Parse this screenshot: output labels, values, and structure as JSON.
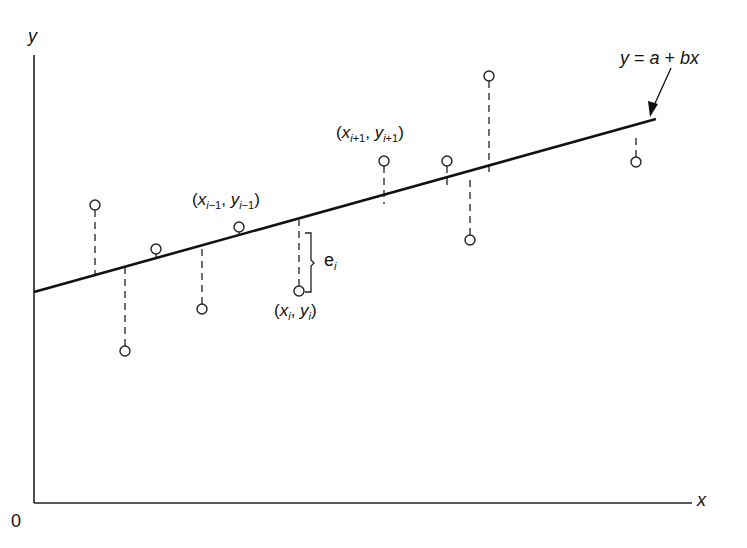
{
  "chart_data": {
    "type": "scatter",
    "title": "",
    "xlabel": "x",
    "ylabel": "y",
    "origin_label": "0",
    "grid": false,
    "legend": null,
    "regression_line": {
      "equation": "y = a + bx",
      "start_px": [
        34,
        292
      ],
      "end_px": [
        656,
        119
      ]
    },
    "points_px": [
      {
        "x": 95,
        "y": 205,
        "line_y": 275
      },
      {
        "x": 125,
        "y": 351,
        "line_y": 267
      },
      {
        "x": 156,
        "y": 249,
        "line_y": 258
      },
      {
        "x": 202,
        "y": 309,
        "line_y": 245
      },
      {
        "x": 239,
        "y": 227,
        "line_y": 236
      },
      {
        "x": 299,
        "y": 291,
        "line_y": 220
      },
      {
        "x": 384,
        "y": 161,
        "line_y": 204
      },
      {
        "x": 447,
        "y": 161,
        "line_y": 186
      },
      {
        "x": 470,
        "y": 240,
        "line_y": 180
      },
      {
        "x": 489,
        "y": 76,
        "line_y": 175
      },
      {
        "x": 636,
        "y": 162,
        "line_y": 134
      }
    ],
    "annotations": [
      {
        "text": "(x_{i-1}, y_{i-1})",
        "point_index": 4
      },
      {
        "text": "(x_i, y_i)",
        "point_index": 5
      },
      {
        "text": "(x_{i+1}, y_{i+1})",
        "point_index": 6
      },
      {
        "text": "e_i",
        "meaning": "residual brace for point i"
      },
      {
        "text": "y = a + bx",
        "meaning": "arrow pointing to regression line"
      }
    ]
  },
  "labels": {
    "y_axis": "y",
    "x_axis": "x",
    "origin": "0",
    "equation": {
      "y": "y",
      "eq": " = ",
      "a": "a",
      "plus": " + ",
      "bx": "bx"
    },
    "prev_point": {
      "open": "(",
      "x": "x",
      "xsub": "i",
      "xsub2": "−1",
      "comma": ", ",
      "y": "y",
      "ysub": "i",
      "ysub2": "−1",
      "close": ")"
    },
    "curr_point": {
      "open": "(",
      "x": "x",
      "xsub": "i",
      "comma": ", ",
      "y": "y",
      "ysub": "i",
      "close": ")"
    },
    "next_point": {
      "open": "(",
      "x": "x",
      "xsub": "i",
      "xsub2": "+1",
      "comma": ", ",
      "y": "y",
      "ysub": "i",
      "ysub2": "+1",
      "close": ")"
    },
    "residual": {
      "e": "e",
      "sub": "i"
    }
  }
}
